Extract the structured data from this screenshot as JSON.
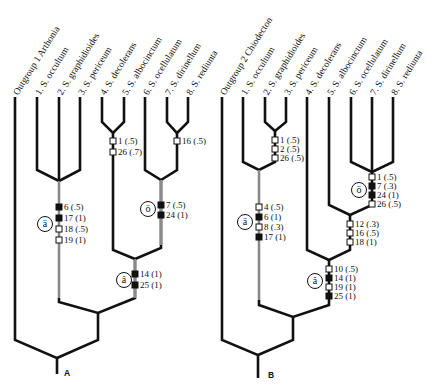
{
  "figure": {
    "panels": [
      {
        "id": "A",
        "label": "A",
        "taxa": [
          "Outgroup 1 Arthonia",
          "1. S. occultum",
          "2. S. graphidioides",
          "3. S. periceum",
          "4. S. decolerans",
          "5. S. albocinctum",
          "6. S. ocellulatum",
          "7. S. dirinellum",
          "8. S. rediunta"
        ],
        "characters": [
          {
            "text": "1 (.5)",
            "state": "open"
          },
          {
            "text": "26 (.7)",
            "state": "open"
          },
          {
            "text": "16 (.5)",
            "state": "open"
          },
          {
            "text": "7 (.5)",
            "state": "filled"
          },
          {
            "text": "24 (1)",
            "state": "filled"
          },
          {
            "text": "6 (.5)",
            "state": "filled"
          },
          {
            "text": "17 (1)",
            "state": "filled"
          },
          {
            "text": "18 (.5)",
            "state": "open"
          },
          {
            "text": "19 (1)",
            "state": "open"
          },
          {
            "text": "14 (1)",
            "state": "filled"
          },
          {
            "text": "25 (1)",
            "state": "filled"
          }
        ],
        "circled": [
          "ö",
          "ä",
          "â"
        ]
      },
      {
        "id": "B",
        "label": "B",
        "taxa": [
          "Outgroup 2 Chiodecton",
          "1. S. occultum",
          "2. S. graphidioides",
          "3. S. periceum",
          "4. S. decolerans",
          "5. S. albocinctum",
          "6. S. ocellulatum",
          "7. S. dirinellum",
          "8. S. rediunta"
        ],
        "characters": [
          {
            "text": "1 (.5)",
            "state": "open"
          },
          {
            "text": "2 (.5)",
            "state": "open"
          },
          {
            "text": "26 (.5)",
            "state": "open"
          },
          {
            "text": "1 (.5)",
            "state": "open"
          },
          {
            "text": "7 (.3)",
            "state": "filled"
          },
          {
            "text": "24 (1)",
            "state": "filled"
          },
          {
            "text": "26 (.5)",
            "state": "open"
          },
          {
            "text": "4 (.5)",
            "state": "open"
          },
          {
            "text": "6 (1)",
            "state": "filled"
          },
          {
            "text": "8 (.3)",
            "state": "open"
          },
          {
            "text": "17 (1)",
            "state": "filled"
          },
          {
            "text": "12 (.3)",
            "state": "open"
          },
          {
            "text": "16 (.5)",
            "state": "open"
          },
          {
            "text": "18 (1)",
            "state": "open"
          },
          {
            "text": "10 (.5)",
            "state": "open"
          },
          {
            "text": "14 (1)",
            "state": "filled"
          },
          {
            "text": "19 (1)",
            "state": "open"
          },
          {
            "text": "25 (1)",
            "state": "filled"
          }
        ],
        "circled": [
          "ö",
          "ä",
          "â"
        ]
      }
    ],
    "colors": {
      "branch": "#111111",
      "stem_grey": "#8a8a8a",
      "filled_marker": "#111111",
      "open_marker": "#ffffff"
    }
  }
}
